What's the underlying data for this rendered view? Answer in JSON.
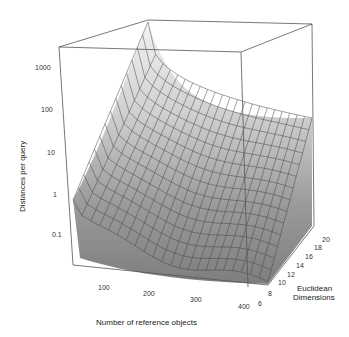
{
  "chart_data": {
    "type": "surface3d",
    "title": "",
    "xlabel": "Number of reference objects",
    "ylabel": "Euclidean Dimensions",
    "zlabel": "Distances per query",
    "x_ticks": [
      "100",
      "200",
      "300",
      "400"
    ],
    "y_ticks": [
      "6",
      "8",
      "10",
      "12",
      "14",
      "16",
      "18",
      "20"
    ],
    "z_ticks": [
      "0.1",
      "1",
      "10",
      "100",
      "1000"
    ],
    "z_scale": "log",
    "xlim": [
      10,
      400
    ],
    "ylim": [
      5,
      21
    ],
    "zlim": [
      0.02,
      2000
    ],
    "series": [
      {
        "name": "dim=20",
        "x": [
          10,
          50,
          100,
          200,
          300,
          400
        ],
        "values": [
          1000,
          150,
          60,
          20,
          12,
          8
        ]
      },
      {
        "name": "dim=12",
        "x": [
          10,
          50,
          100,
          200,
          300,
          400
        ],
        "values": [
          60,
          8,
          2,
          0.6,
          0.4,
          0.3
        ]
      },
      {
        "name": "dim=6",
        "x": [
          10,
          50,
          100,
          200,
          300,
          400
        ],
        "values": [
          1.5,
          0.2,
          0.08,
          0.05,
          0.05,
          0.05
        ]
      }
    ],
    "grid": false,
    "legend": null
  },
  "labels": {
    "z_axis": "Distances per query",
    "x_axis": "Number of reference objects",
    "y_axis_line1": "Euclidean",
    "y_axis_line2": "Dimensions",
    "z_ticks": [
      "1000",
      "100",
      "10",
      "1",
      "0.1"
    ],
    "x_ticks": [
      "100",
      "200",
      "300",
      "400"
    ],
    "y_ticks": [
      "6",
      "8",
      "10",
      "12",
      "14",
      "16",
      "18",
      "20"
    ]
  }
}
